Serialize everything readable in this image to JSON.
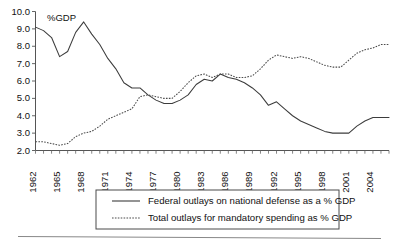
{
  "chart_data": {
    "type": "line",
    "title": "",
    "subtitle": "",
    "xlabel": "",
    "ylabel": "",
    "unit_note": "%GDP",
    "grid": false,
    "legend_position": "bottom",
    "xlim": [
      1962,
      2006
    ],
    "ylim": [
      2.0,
      10.0
    ],
    "ytick_labels": [
      "10.0",
      "9.0",
      "8.0",
      "7.0",
      "6.0",
      "5.0",
      "4.0",
      "3.0",
      "2.0"
    ],
    "ytick_values": [
      10.0,
      9.0,
      8.0,
      7.0,
      6.0,
      5.0,
      4.0,
      3.0,
      2.0
    ],
    "xtick_labels": [
      "1962",
      "1965",
      "1968",
      "1971",
      "1974",
      "1977",
      "1980",
      "1983",
      "1986",
      "1989",
      "1992",
      "1995",
      "1998",
      "2001",
      "2004"
    ],
    "xtick_values": [
      1962,
      1965,
      1968,
      1971,
      1974,
      1977,
      1980,
      1983,
      1986,
      1989,
      1992,
      1995,
      1998,
      2001,
      2004
    ],
    "x": [
      1962,
      1963,
      1964,
      1965,
      1966,
      1967,
      1968,
      1969,
      1970,
      1971,
      1972,
      1973,
      1974,
      1975,
      1976,
      1977,
      1978,
      1979,
      1980,
      1981,
      1982,
      1983,
      1984,
      1985,
      1986,
      1987,
      1988,
      1989,
      1990,
      1991,
      1992,
      1993,
      1994,
      1995,
      1996,
      1997,
      1998,
      1999,
      2000,
      2001,
      2002,
      2003,
      2004,
      2005,
      2006
    ],
    "series": [
      {
        "name": "Federal outlays on national defense as a % GDP",
        "style": "solid",
        "color": "#3c3c3c",
        "values": [
          9.1,
          8.9,
          8.5,
          7.4,
          7.7,
          8.8,
          9.4,
          8.7,
          8.1,
          7.3,
          6.7,
          5.9,
          5.6,
          5.6,
          5.2,
          4.9,
          4.7,
          4.7,
          4.9,
          5.2,
          5.8,
          6.1,
          6.0,
          6.4,
          6.2,
          6.1,
          5.9,
          5.6,
          5.2,
          4.6,
          4.8,
          4.4,
          4.0,
          3.7,
          3.5,
          3.3,
          3.1,
          3.0,
          3.0,
          3.0,
          3.4,
          3.7,
          3.9,
          3.9,
          3.9
        ]
      },
      {
        "name": "Total outlays for mandatory spending as % GDP",
        "style": "dotted",
        "color": "#4a4a4a",
        "values": [
          2.5,
          2.5,
          2.4,
          2.3,
          2.4,
          2.8,
          3.0,
          3.1,
          3.4,
          3.8,
          4.0,
          4.2,
          4.4,
          5.1,
          5.2,
          5.1,
          5.0,
          5.0,
          5.4,
          5.9,
          6.3,
          6.4,
          6.2,
          6.4,
          6.4,
          6.2,
          6.2,
          6.3,
          6.7,
          7.2,
          7.5,
          7.4,
          7.3,
          7.4,
          7.3,
          7.1,
          6.9,
          6.8,
          6.8,
          7.2,
          7.6,
          7.8,
          7.9,
          8.1,
          8.1
        ]
      }
    ],
    "legend": [
      {
        "label": "Federal outlays on national defense as a % GDP",
        "style": "solid"
      },
      {
        "label": "Total outlays for mandatory spending as % GDP",
        "style": "dotted"
      }
    ]
  }
}
